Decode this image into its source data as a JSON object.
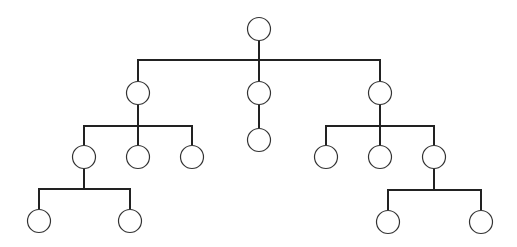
{
  "diagram": {
    "type": "tree",
    "colors": {
      "edge": "#222222",
      "node_stroke": "#333333",
      "node_fill": "#ffffff",
      "background": "#ffffff"
    },
    "node_radius": 11.5,
    "nodes": [
      {
        "id": "root",
        "x": 259,
        "y": 29
      },
      {
        "id": "a",
        "x": 138,
        "y": 93
      },
      {
        "id": "b",
        "x": 259,
        "y": 93
      },
      {
        "id": "c",
        "x": 380,
        "y": 93
      },
      {
        "id": "a1",
        "x": 84,
        "y": 157
      },
      {
        "id": "a2",
        "x": 138,
        "y": 157
      },
      {
        "id": "a3",
        "x": 192,
        "y": 157
      },
      {
        "id": "b1",
        "x": 259,
        "y": 140
      },
      {
        "id": "c1",
        "x": 326,
        "y": 157
      },
      {
        "id": "c2",
        "x": 380,
        "y": 157
      },
      {
        "id": "c3",
        "x": 434,
        "y": 157
      },
      {
        "id": "a1a",
        "x": 39,
        "y": 221
      },
      {
        "id": "a1b",
        "x": 130,
        "y": 221
      },
      {
        "id": "c3a",
        "x": 388,
        "y": 222
      },
      {
        "id": "c3b",
        "x": 481,
        "y": 222
      }
    ],
    "edges": [
      {
        "points": [
          [
            259,
            41
          ],
          [
            259,
            60
          ]
        ]
      },
      {
        "points": [
          [
            138,
            81
          ],
          [
            138,
            60
          ],
          [
            380,
            60
          ],
          [
            380,
            81
          ]
        ]
      },
      {
        "points": [
          [
            259,
            60
          ],
          [
            259,
            81
          ]
        ]
      },
      {
        "points": [
          [
            138,
            105
          ],
          [
            138,
            126
          ]
        ]
      },
      {
        "points": [
          [
            84,
            145
          ],
          [
            84,
            126
          ],
          [
            192,
            126
          ],
          [
            192,
            145
          ]
        ]
      },
      {
        "points": [
          [
            138,
            126
          ],
          [
            138,
            145
          ]
        ]
      },
      {
        "points": [
          [
            259,
            105
          ],
          [
            259,
            128
          ]
        ]
      },
      {
        "points": [
          [
            380,
            105
          ],
          [
            380,
            126
          ]
        ]
      },
      {
        "points": [
          [
            326,
            145
          ],
          [
            326,
            126
          ],
          [
            434,
            126
          ],
          [
            434,
            145
          ]
        ]
      },
      {
        "points": [
          [
            380,
            126
          ],
          [
            380,
            145
          ]
        ]
      },
      {
        "points": [
          [
            84,
            169
          ],
          [
            84,
            189
          ]
        ]
      },
      {
        "points": [
          [
            39,
            209
          ],
          [
            39,
            189
          ],
          [
            130,
            189
          ],
          [
            130,
            209
          ]
        ]
      },
      {
        "points": [
          [
            434,
            169
          ],
          [
            434,
            190
          ]
        ]
      },
      {
        "points": [
          [
            388,
            210
          ],
          [
            388,
            190
          ],
          [
            481,
            190
          ],
          [
            481,
            210
          ]
        ]
      }
    ]
  }
}
